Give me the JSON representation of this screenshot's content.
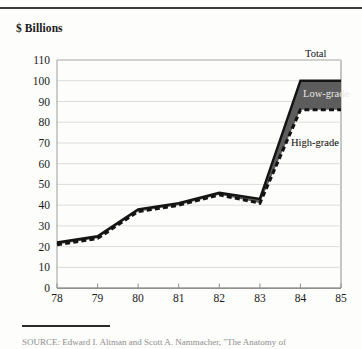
{
  "figure": {
    "axis_title": "$ Billions",
    "source_note": "SOURCE: Edward I. Altman and Scott A. Nammacher, \"The Anatomy of",
    "series_labels": {
      "total": "Total",
      "low_grade": "Low-grade",
      "high_grade": "High-grade"
    },
    "colors": {
      "band_fill": "#5d5d5d",
      "total_line": "#141414",
      "high_grade_line": "#141414",
      "gridline": "#d8d8d4",
      "axis": "#6b6b6b",
      "background": "#fdfdfb"
    }
  },
  "chart_data": {
    "type": "area",
    "title": "",
    "subtitle": "",
    "xlabel": "",
    "ylabel": "$ Billions",
    "ylim": [
      0,
      110
    ],
    "yticks": [
      0,
      10,
      20,
      30,
      40,
      50,
      60,
      70,
      80,
      90,
      100,
      110
    ],
    "ytick_labels": [
      "0",
      "10",
      "20",
      "30",
      "40",
      "50",
      "60",
      "70",
      "80",
      "90",
      "100",
      "110"
    ],
    "categories": [
      "78",
      "79",
      "80",
      "81",
      "82",
      "83",
      "84",
      "85"
    ],
    "xtick_labels": [
      "78",
      "79",
      "80",
      "81",
      "82",
      "83",
      "84",
      "85"
    ],
    "grid": true,
    "legend_position": "inline-right",
    "annotations": [
      "Total",
      "Low-grade",
      "High-grade"
    ],
    "series": [
      {
        "name": "Total",
        "style": "solid",
        "values": [
          22,
          25,
          38,
          41,
          46,
          43,
          100,
          100
        ]
      },
      {
        "name": "High-grade",
        "style": "dashed",
        "values": [
          21,
          24,
          37,
          40,
          45,
          41,
          86,
          86
        ]
      },
      {
        "name": "Low-grade",
        "style": "shaded-band",
        "note": "difference between Total and High-grade",
        "values": [
          1,
          1,
          1,
          1,
          1,
          2,
          14,
          14
        ]
      }
    ]
  }
}
